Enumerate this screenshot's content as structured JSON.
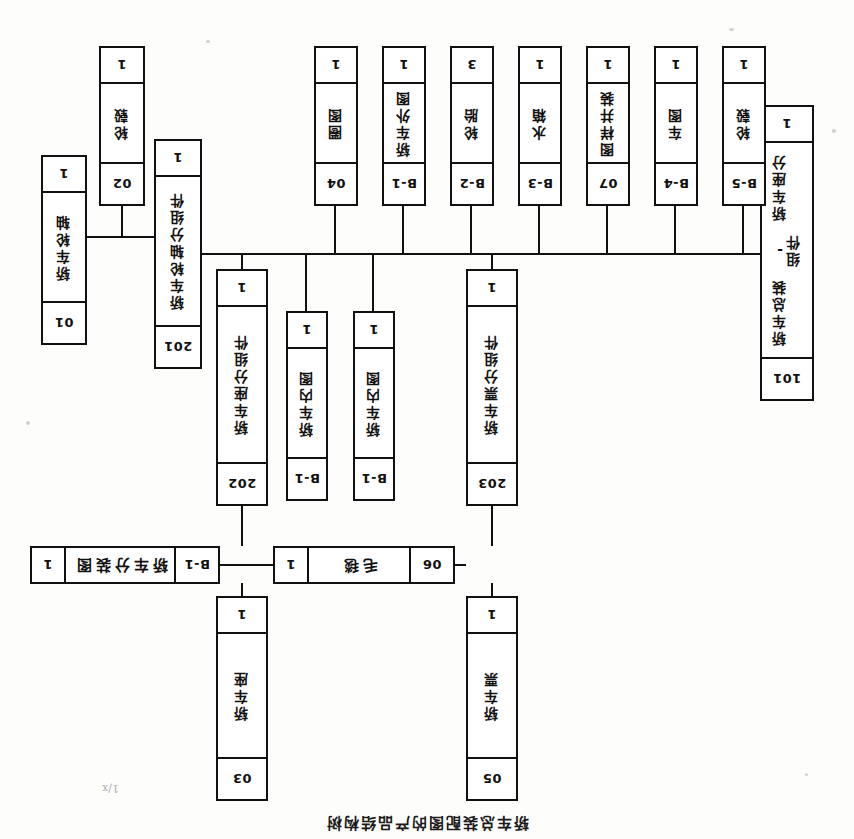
{
  "document": {
    "title": "轿车总装配图的产品结构树",
    "orientation_note": "180"
  },
  "marks": {
    "corner_scribble": "1/x"
  },
  "nodes": [
    {
      "id": "n05",
      "code": "05",
      "name": "轿车票",
      "qty": "1",
      "layout": "vert",
      "x": 336,
      "y": 38,
      "w": 52,
      "h": 205
    },
    {
      "id": "n03",
      "code": "03",
      "name": "轿车座",
      "qty": "1",
      "layout": "vert",
      "x": 586,
      "y": 38,
      "w": 52,
      "h": 205
    },
    {
      "id": "n06",
      "code": "06",
      "name": "毛毯",
      "qty": "1",
      "layout": "horz",
      "x": 399,
      "y": 255,
      "w": 182,
      "h": 38
    },
    {
      "id": "nB1a",
      "code": "B-1",
      "name": "轿车分装图",
      "qty": "1",
      "layout": "horz",
      "x": 634,
      "y": 255,
      "w": 190,
      "h": 38
    },
    {
      "id": "n203",
      "code": "203",
      "name": "轿车票分组件",
      "qty": "1",
      "layout": "vert",
      "x": 336,
      "y": 333,
      "w": 52,
      "h": 237
    },
    {
      "id": "nB1b",
      "code": "B-1",
      "name": "轿车内图",
      "qty": "1",
      "layout": "vert",
      "x": 459,
      "y": 338,
      "w": 42,
      "h": 190
    },
    {
      "id": "nB1c",
      "code": "B-1",
      "name": "轿车内图",
      "qty": "1",
      "layout": "vert",
      "x": 526,
      "y": 338,
      "w": 42,
      "h": 190
    },
    {
      "id": "n202",
      "code": "202",
      "name": "轿车座分组件",
      "qty": "1",
      "layout": "vert",
      "x": 586,
      "y": 333,
      "w": 52,
      "h": 237
    },
    {
      "id": "n101",
      "code": "101",
      "name": "轿车总装 - 轿车座分组件",
      "qty": "1",
      "layout": "vert",
      "x": 40,
      "y": 438,
      "w": 54,
      "h": 296
    },
    {
      "id": "n201",
      "code": "201",
      "name": "轿车轮轴分组件",
      "qty": "1",
      "layout": "vert",
      "x": 652,
      "y": 470,
      "w": 48,
      "h": 230
    },
    {
      "id": "n01",
      "code": "01",
      "name": "轿车轮轴",
      "qty": "1",
      "layout": "vert",
      "x": 767,
      "y": 494,
      "w": 46,
      "h": 190
    },
    {
      "id": "n02",
      "code": "02",
      "name": "轮毂",
      "qty": "1",
      "layout": "vert",
      "x": 709,
      "y": 633,
      "w": 46,
      "h": 160
    },
    {
      "id": "nB5",
      "code": "B-5",
      "name": "轮毂",
      "qty": "1",
      "layout": "vert",
      "x": 88,
      "y": 633,
      "w": 44,
      "h": 160
    },
    {
      "id": "nB4",
      "code": "B-4",
      "name": "车图",
      "qty": "1",
      "layout": "vert",
      "x": 156,
      "y": 633,
      "w": 44,
      "h": 160
    },
    {
      "id": "n07",
      "code": "07",
      "name": "图样并装",
      "qty": "1",
      "layout": "vert",
      "x": 224,
      "y": 633,
      "w": 44,
      "h": 160
    },
    {
      "id": "nB3",
      "code": "B-3",
      "name": "水箱",
      "qty": "1",
      "layout": "vert",
      "x": 292,
      "y": 633,
      "w": 44,
      "h": 160
    },
    {
      "id": "nB2",
      "code": "B-2",
      "name": "轮胎",
      "qty": "3",
      "layout": "vert",
      "x": 360,
      "y": 633,
      "w": 44,
      "h": 160
    },
    {
      "id": "nB1d",
      "code": "B-1",
      "name": "轿车外图",
      "qty": "1",
      "layout": "vert",
      "x": 428,
      "y": 633,
      "w": 44,
      "h": 160
    },
    {
      "id": "n04",
      "code": "04",
      "name": "圈图",
      "qty": "1",
      "layout": "vert",
      "x": 496,
      "y": 633,
      "w": 44,
      "h": 160
    }
  ],
  "connectors": [
    {
      "id": "c1",
      "type": "v",
      "x": 361,
      "y": 243,
      "len": 13
    },
    {
      "id": "c2",
      "type": "v",
      "x": 361,
      "y": 293,
      "len": 40
    },
    {
      "id": "c3",
      "type": "v",
      "x": 611,
      "y": 243,
      "len": 13
    },
    {
      "id": "c4",
      "type": "v",
      "x": 611,
      "y": 293,
      "len": 40
    },
    {
      "id": "c5",
      "type": "h",
      "x": 581,
      "y": 273,
      "len": 53
    },
    {
      "id": "c6",
      "type": "h",
      "x": 388,
      "y": 273,
      "len": 11
    },
    {
      "id": "c7",
      "type": "h",
      "x": 94,
      "y": 584,
      "len": 558
    },
    {
      "id": "c8",
      "type": "v",
      "x": 361,
      "y": 570,
      "len": 14
    },
    {
      "id": "c9",
      "type": "v",
      "x": 480,
      "y": 528,
      "len": 56
    },
    {
      "id": "c10",
      "type": "v",
      "x": 547,
      "y": 528,
      "len": 56
    },
    {
      "id": "c11",
      "type": "v",
      "x": 611,
      "y": 570,
      "len": 14
    },
    {
      "id": "c12",
      "type": "v",
      "x": 110,
      "y": 584,
      "len": 49
    },
    {
      "id": "c13",
      "type": "v",
      "x": 178,
      "y": 584,
      "len": 49
    },
    {
      "id": "c14",
      "type": "v",
      "x": 246,
      "y": 584,
      "len": 49
    },
    {
      "id": "c15",
      "type": "v",
      "x": 314,
      "y": 584,
      "len": 49
    },
    {
      "id": "c16",
      "type": "v",
      "x": 382,
      "y": 584,
      "len": 49
    },
    {
      "id": "c17",
      "type": "v",
      "x": 450,
      "y": 584,
      "len": 49
    },
    {
      "id": "c18",
      "type": "v",
      "x": 518,
      "y": 584,
      "len": 49
    },
    {
      "id": "c19",
      "type": "h",
      "x": 700,
      "y": 601,
      "len": 67
    },
    {
      "id": "c20",
      "type": "v",
      "x": 731,
      "y": 601,
      "len": 32
    }
  ],
  "specks": [
    {
      "x": 18,
      "y": 706,
      "w": 4,
      "h": 4
    },
    {
      "x": 120,
      "y": 808,
      "w": 5,
      "h": 3
    },
    {
      "x": 824,
      "y": 414,
      "w": 4,
      "h": 4
    },
    {
      "x": 46,
      "y": 63,
      "w": 3,
      "h": 3
    },
    {
      "x": 644,
      "y": 796,
      "w": 4,
      "h": 3
    }
  ]
}
